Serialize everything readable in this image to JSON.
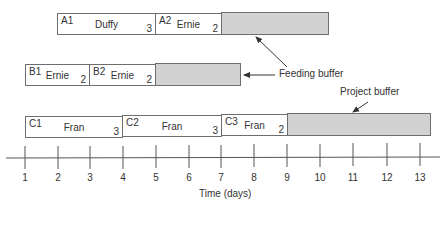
{
  "rows": {
    "A": {
      "tasks": [
        {
          "id": "A1",
          "resource": "Duffy",
          "duration": "3"
        },
        {
          "id": "A2",
          "resource": "Ernie",
          "duration": "2"
        }
      ]
    },
    "B": {
      "tasks": [
        {
          "id": "B1",
          "resource": "Ernie",
          "duration": "2"
        },
        {
          "id": "B2",
          "resource": "Ernie",
          "duration": "2"
        }
      ]
    },
    "C": {
      "tasks": [
        {
          "id": "C1",
          "resource": "Fran",
          "duration": "3"
        },
        {
          "id": "C2",
          "resource": "Fran",
          "duration": "3"
        },
        {
          "id": "C3",
          "resource": "Fran",
          "duration": "2"
        }
      ]
    }
  },
  "annotations": {
    "feeding_buffer": "Feeding buffer",
    "project_buffer": "Project buffer"
  },
  "axis": {
    "label": "Time (days)",
    "ticks": [
      "1",
      "2",
      "3",
      "4",
      "5",
      "6",
      "7",
      "8",
      "9",
      "10",
      "11",
      "12",
      "13"
    ]
  },
  "colors": {
    "buffer_fill": "#d2d2d2",
    "task_fill": "#ffffff",
    "line": "#6e6e6e"
  }
}
